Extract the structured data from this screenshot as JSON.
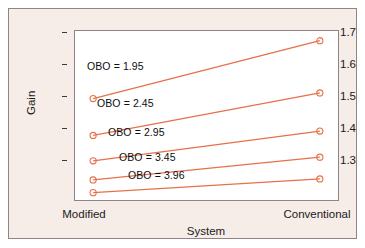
{
  "chart_data": {
    "type": "line",
    "title": "",
    "subtitle": "",
    "xlabel": "System",
    "ylabel": "Gain",
    "categories": [
      "Modified",
      "Conventional"
    ],
    "x": [
      0,
      1
    ],
    "xlim": [
      -0.08,
      1.08
    ],
    "ylim": [
      1.24,
      1.745
    ],
    "yticks": [
      1.3,
      1.4,
      1.5,
      1.6,
      1.7
    ],
    "ytick_labels": [
      "1.3",
      "1.4",
      "1.5",
      "1.6",
      "1.7"
    ],
    "xtick_labels": [
      "Modified",
      "Conventional"
    ],
    "grid": false,
    "legend": "none",
    "marker": "circle-open",
    "line_color": "#e8704a",
    "marker_color": "#e8704a",
    "series": [
      {
        "name": "OBO = 1.95",
        "label": "OBO = 1.95",
        "values": [
          1.543,
          1.716
        ]
      },
      {
        "name": "OBO = 2.45",
        "label": "OBO = 2.45",
        "values": [
          1.433,
          1.56
        ]
      },
      {
        "name": "OBO = 2.95",
        "label": "OBO = 2.95",
        "values": [
          1.357,
          1.446
        ]
      },
      {
        "name": "OBO = 3.45",
        "label": "OBO = 3.45",
        "values": [
          1.3,
          1.368
        ]
      },
      {
        "name": "OBO = 3.96",
        "label": "OBO = 3.96",
        "values": [
          1.262,
          1.303
        ]
      }
    ],
    "annotations": [
      {
        "text": "OBO = 1.95",
        "x": 0.14,
        "y": 1.628
      },
      {
        "text": "OBO = 2.45",
        "x": 0.22,
        "y": 1.518
      },
      {
        "text": "OBO = 2.95",
        "x": 0.3,
        "y": 1.433
      },
      {
        "text": "OBO = 3.45",
        "x": 0.38,
        "y": 1.359
      },
      {
        "text": "OBO = 3.96",
        "x": 0.44,
        "y": 1.307
      }
    ]
  },
  "colors": {
    "panel_background": "#f6ece8",
    "plot_background": "#ffffff",
    "frame": "#8e8486",
    "series": "#e8704a",
    "text": "#1b1b1b"
  },
  "axes": {
    "y_title": "Gain",
    "x_title": "System",
    "y_tick_0": "1.3",
    "y_tick_1": "1.4",
    "y_tick_2": "1.5",
    "y_tick_3": "1.6",
    "y_tick_4": "1.7",
    "x_tick_0": "Modified",
    "x_tick_1": "Conventional"
  },
  "labels": {
    "obo_1": "OBO = 1.95",
    "obo_2": "OBO = 2.45",
    "obo_3": "OBO = 2.95",
    "obo_4": "OBO = 3.45",
    "obo_5": "OBO = 3.96"
  }
}
